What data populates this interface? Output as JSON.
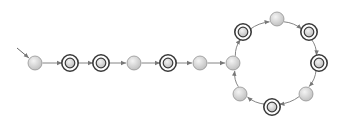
{
  "diagram": {
    "type": "finite-automaton",
    "width": 343,
    "height": 123,
    "node_radius": 7,
    "colors": {
      "node_fill_light": "#f4f4f4",
      "node_fill_dark": "#bdbdbd",
      "node_stroke": "#8a8a8a",
      "accepting_ring": "#3a3a3a",
      "edge": "#777777",
      "background": "#ffffff"
    },
    "start_arrow": {
      "from": [
        17,
        48
      ],
      "to": "q0"
    },
    "nodes": [
      {
        "id": "q0",
        "x": 35,
        "y": 63,
        "accepting": false,
        "initial": true
      },
      {
        "id": "q1",
        "x": 70,
        "y": 63,
        "accepting": true
      },
      {
        "id": "q2",
        "x": 101,
        "y": 63,
        "accepting": true
      },
      {
        "id": "q3",
        "x": 134,
        "y": 63,
        "accepting": false
      },
      {
        "id": "q4",
        "x": 168,
        "y": 63,
        "accepting": true
      },
      {
        "id": "q5",
        "x": 200,
        "y": 63,
        "accepting": false
      },
      {
        "id": "q6",
        "x": 233,
        "y": 63,
        "accepting": false
      },
      {
        "id": "q7",
        "x": 243,
        "y": 32,
        "accepting": true
      },
      {
        "id": "q8",
        "x": 277,
        "y": 19,
        "accepting": false
      },
      {
        "id": "q9",
        "x": 309,
        "y": 32,
        "accepting": true
      },
      {
        "id": "q10",
        "x": 319,
        "y": 63,
        "accepting": true
      },
      {
        "id": "q11",
        "x": 306,
        "y": 94,
        "accepting": false
      },
      {
        "id": "q12",
        "x": 272,
        "y": 107,
        "accepting": true
      },
      {
        "id": "q13",
        "x": 240,
        "y": 94,
        "accepting": false
      }
    ],
    "edges": [
      {
        "from": "q0",
        "to": "q1",
        "curve": 0
      },
      {
        "from": "q1",
        "to": "q2",
        "curve": 0
      },
      {
        "from": "q2",
        "to": "q3",
        "curve": 0
      },
      {
        "from": "q3",
        "to": "q4",
        "curve": 0
      },
      {
        "from": "q4",
        "to": "q5",
        "curve": 0
      },
      {
        "from": "q5",
        "to": "q6",
        "curve": 0
      },
      {
        "from": "q6",
        "to": "q7",
        "curve": 3
      },
      {
        "from": "q7",
        "to": "q8",
        "curve": 3
      },
      {
        "from": "q8",
        "to": "q9",
        "curve": 3
      },
      {
        "from": "q9",
        "to": "q10",
        "curve": 3
      },
      {
        "from": "q10",
        "to": "q11",
        "curve": 3
      },
      {
        "from": "q11",
        "to": "q12",
        "curve": 3
      },
      {
        "from": "q12",
        "to": "q13",
        "curve": 3
      },
      {
        "from": "q13",
        "to": "q6",
        "curve": 3
      }
    ]
  }
}
